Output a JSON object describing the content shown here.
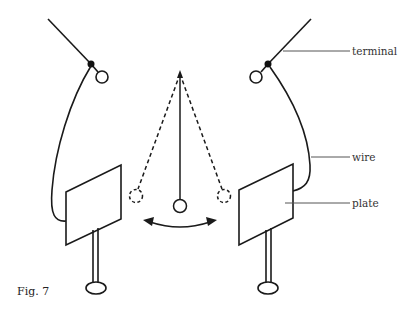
{
  "diagram": {
    "type": "electroscope-pendulum",
    "figure_label": "Fig. 7",
    "labels": {
      "terminal": "terminal",
      "wire": "wire",
      "plate": "plate"
    },
    "colors": {
      "stroke": "#1a1a1a",
      "leader": "#555555",
      "background": "#ffffff"
    }
  }
}
